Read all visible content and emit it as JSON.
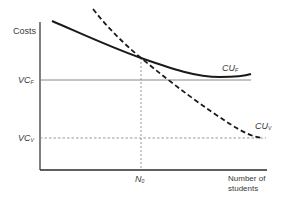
{
  "diagram": {
    "y_axis_label": "Costs",
    "x_axis_label_line1": "Number of",
    "x_axis_label_line2": "students",
    "levels": [
      {
        "main": "VC",
        "sub": "F",
        "style": "solid"
      },
      {
        "main": "VC",
        "sub": "V",
        "style": "dashed"
      }
    ],
    "curves": [
      {
        "main": "CU",
        "sub": "F",
        "style": "solid",
        "shape": "decreasing, flattening and slightly rising at right end"
      },
      {
        "main": "CU",
        "sub": "V",
        "style": "dashed",
        "shape": "steeply decreasing, approaching VC_V"
      }
    ],
    "breakeven": {
      "main": "N",
      "sub": "0"
    },
    "colors": {
      "curve": "#1a1a1a",
      "axis": "#2a2a2a",
      "guide": "#7a7a7a",
      "text": "#3a3a3a"
    }
  }
}
